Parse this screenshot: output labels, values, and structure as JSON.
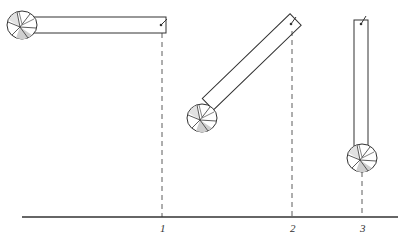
{
  "diagram": {
    "colors": {
      "stroke": "#333333",
      "fill": "#ffffff",
      "shade": "#bdbdbd"
    },
    "positions": [
      {
        "id": 1,
        "label": "1",
        "pivot": [
          162,
          25
        ],
        "angle_deg": 0,
        "ball_center": [
          22,
          25
        ],
        "projection_x": 162
      },
      {
        "id": 2,
        "label": "2",
        "pivot": [
          292,
          23
        ],
        "angle_deg": 46,
        "ball_center": [
          202,
          118
        ],
        "projection_x": 292
      },
      {
        "id": 3,
        "label": "3",
        "pivot": [
          362,
          22
        ],
        "angle_deg": 90,
        "ball_center": [
          362,
          158
        ],
        "projection_x": 362
      }
    ],
    "baseline": {
      "y": 217,
      "x1": 22,
      "x2": 398
    }
  }
}
